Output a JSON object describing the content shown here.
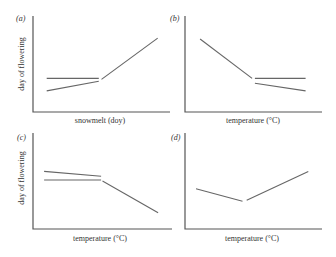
{
  "chart_data": [
    {
      "type": "line",
      "panel": "(a)",
      "xlabel": "snowmelt (doy)",
      "ylabel": "day of flowering",
      "xlim": [
        0,
        1
      ],
      "ylim": [
        0,
        1
      ],
      "grid": false,
      "series": [
        {
          "name": "flat-segment",
          "points": [
            [
              0.1,
              0.35
            ],
            [
              0.48,
              0.35
            ]
          ]
        },
        {
          "name": "lower-segment",
          "points": [
            [
              0.1,
              0.22
            ],
            [
              0.48,
              0.32
            ]
          ]
        },
        {
          "name": "rising-segment",
          "points": [
            [
              0.5,
              0.34
            ],
            [
              0.91,
              0.77
            ]
          ]
        }
      ]
    },
    {
      "type": "line",
      "panel": "(b)",
      "xlabel": "temperature (°C)",
      "ylabel": "",
      "xlim": [
        0,
        1
      ],
      "ylim": [
        0,
        1
      ],
      "grid": false,
      "series": [
        {
          "name": "descending-segment",
          "points": [
            [
              0.11,
              0.76
            ],
            [
              0.49,
              0.35
            ]
          ]
        },
        {
          "name": "flat-segment",
          "points": [
            [
              0.51,
              0.35
            ],
            [
              0.88,
              0.35
            ]
          ]
        },
        {
          "name": "lower-segment",
          "points": [
            [
              0.51,
              0.3
            ],
            [
              0.88,
              0.22
            ]
          ]
        }
      ]
    },
    {
      "type": "line",
      "panel": "(c)",
      "xlabel": "temperature (°C)",
      "ylabel": "day of flowering",
      "xlim": [
        0,
        1
      ],
      "ylim": [
        0,
        1
      ],
      "grid": false,
      "series": [
        {
          "name": "upper-segment",
          "points": [
            [
              0.08,
              0.6
            ],
            [
              0.49,
              0.55
            ]
          ]
        },
        {
          "name": "flat-segment",
          "points": [
            [
              0.08,
              0.51
            ],
            [
              0.49,
              0.51
            ]
          ]
        },
        {
          "name": "descending-segment",
          "points": [
            [
              0.5,
              0.5
            ],
            [
              0.9,
              0.17
            ]
          ]
        }
      ]
    },
    {
      "type": "line",
      "panel": "(d)",
      "xlabel": "temperature (°C)",
      "ylabel": "",
      "xlim": [
        0,
        1
      ],
      "ylim": [
        0,
        1
      ],
      "grid": false,
      "series": [
        {
          "name": "descending-segment",
          "points": [
            [
              0.08,
              0.42
            ],
            [
              0.42,
              0.29
            ]
          ]
        },
        {
          "name": "rising-segment",
          "points": [
            [
              0.45,
              0.3
            ],
            [
              0.9,
              0.6
            ]
          ]
        }
      ]
    }
  ]
}
